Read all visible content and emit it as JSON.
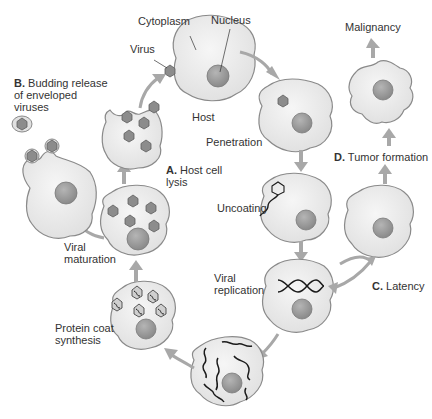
{
  "labels": {
    "cytoplasm": "Cytoplasm",
    "nucleus": "Nucleus",
    "virus": "Virus",
    "host": "Host",
    "penetration": "Penetration",
    "uncoating": "Uncoating",
    "viral_replication_1": "Viral",
    "viral_replication_2": "replication",
    "protein_coat_1": "Protein coat",
    "protein_coat_2": "synthesis",
    "viral_maturation_1": "Viral",
    "viral_maturation_2": "maturation",
    "host_lysis_letter": "A.",
    "host_lysis_1": " Host cell",
    "host_lysis_2": "lysis",
    "budding_letter": "B.",
    "budding_1": " Budding release",
    "budding_2": "of enveloped",
    "budding_3": "viruses",
    "latency_letter": "C.",
    "latency": " Latency",
    "tumor_letter": "D.",
    "tumor": " Tumor formation",
    "malignancy": "Malignancy"
  },
  "colors": {
    "cell_fill": "#ececec",
    "cell_stroke": "#8a8a8a",
    "nucleus_fill": "#9a9a9a",
    "virus_fill": "#8c8c8c",
    "arrow_fill": "#a8a8a8",
    "genome_stroke": "#1a1a1a"
  }
}
